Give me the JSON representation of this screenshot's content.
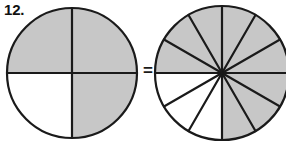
{
  "problem": {
    "number_label": "12.",
    "relation_symbol": "=",
    "statement": "three fourths equals nine twelfths"
  },
  "colors": {
    "shaded_fill": "#c7c7c7",
    "unshaded_fill": "#ffffff",
    "stroke": "#1a1a1a",
    "background": "#ffffff",
    "label_color": "#111111"
  },
  "geometry": {
    "left_circle": {
      "cx": 72,
      "cy": 73,
      "r": 65
    },
    "right_circle": {
      "cx": 222,
      "cy": 73,
      "r": 67
    },
    "stroke_width": 2.2
  },
  "left_figure": {
    "name": "quartered-circle",
    "total_sectors": 4,
    "shaded_sectors": 3,
    "fraction_text": "3/4",
    "sector_angle_degrees": 90,
    "start_angle_degrees": -90,
    "unshaded_sector_indices": [
      2
    ],
    "sectors": [
      {
        "index": 0,
        "label": "top-right-quadrant",
        "start_deg": -90,
        "end_deg": 0,
        "shaded": true
      },
      {
        "index": 1,
        "label": "bottom-right-quadrant",
        "start_deg": 0,
        "end_deg": 90,
        "shaded": true
      },
      {
        "index": 2,
        "label": "bottom-left-quadrant",
        "start_deg": 90,
        "end_deg": 180,
        "shaded": false
      },
      {
        "index": 3,
        "label": "top-left-quadrant",
        "start_deg": 180,
        "end_deg": 270,
        "shaded": true
      }
    ]
  },
  "right_figure": {
    "name": "twelfths-circle",
    "total_sectors": 12,
    "shaded_sectors": 9,
    "fraction_text": "9/12",
    "sector_angle_degrees": 30,
    "start_angle_degrees": -90,
    "unshaded_sector_indices": [
      6,
      7,
      8
    ],
    "sectors": [
      {
        "index": 0,
        "start_deg": -90,
        "end_deg": -60,
        "shaded": true
      },
      {
        "index": 1,
        "start_deg": -60,
        "end_deg": -30,
        "shaded": true
      },
      {
        "index": 2,
        "start_deg": -30,
        "end_deg": 0,
        "shaded": true
      },
      {
        "index": 3,
        "start_deg": 0,
        "end_deg": 30,
        "shaded": true
      },
      {
        "index": 4,
        "start_deg": 30,
        "end_deg": 60,
        "shaded": true
      },
      {
        "index": 5,
        "start_deg": 60,
        "end_deg": 90,
        "shaded": true
      },
      {
        "index": 6,
        "start_deg": 90,
        "end_deg": 120,
        "shaded": false
      },
      {
        "index": 7,
        "start_deg": 120,
        "end_deg": 150,
        "shaded": false
      },
      {
        "index": 8,
        "start_deg": 150,
        "end_deg": 180,
        "shaded": false
      },
      {
        "index": 9,
        "start_deg": 180,
        "end_deg": 210,
        "shaded": true
      },
      {
        "index": 10,
        "start_deg": 210,
        "end_deg": 240,
        "shaded": true
      },
      {
        "index": 11,
        "start_deg": 240,
        "end_deg": 270,
        "shaded": true
      }
    ]
  }
}
